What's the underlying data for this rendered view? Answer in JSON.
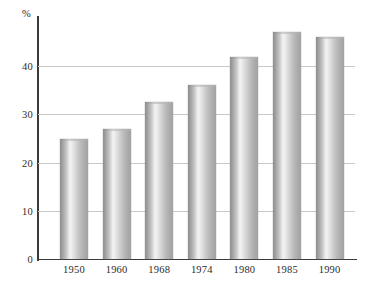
{
  "chart_data": {
    "type": "bar",
    "title": "",
    "subtitle": "",
    "xlabel": "",
    "ylabel": "%",
    "unit_label": "%",
    "categories": [
      "1950",
      "1960",
      "1968",
      "1974",
      "1980",
      "1985",
      "1990"
    ],
    "values": [
      25,
      27,
      32.5,
      36,
      42,
      47,
      46
    ],
    "series": [
      {
        "name": "",
        "values": [
          25,
          27,
          32.5,
          36,
          42,
          47,
          46
        ]
      }
    ],
    "ylim": [
      0,
      50
    ],
    "yticks": [
      0,
      10,
      20,
      30,
      40
    ],
    "ytick_labels": [
      "0",
      "10",
      "20",
      "30",
      "40"
    ],
    "grid": "horizontal",
    "legend": "none",
    "legend_position": "",
    "annotations": [],
    "colors": {
      "bar_dark": "#8f8f8f",
      "bar_highlight": "#f2f2f2",
      "bar_mid": "#bdbdbd",
      "gridline": "#c9c9c9",
      "axis": "#3a3a3a",
      "text": "#2b2b2b",
      "background": "#ffffff"
    }
  }
}
